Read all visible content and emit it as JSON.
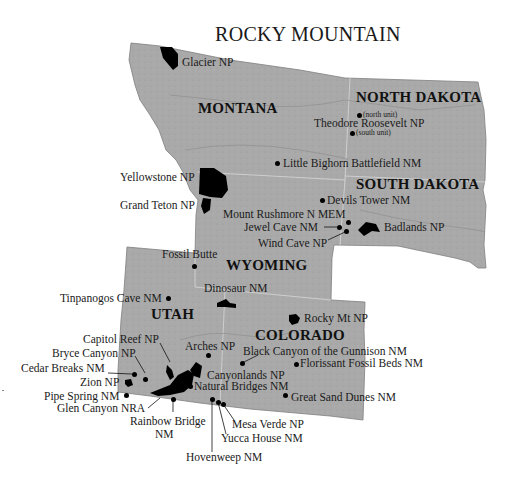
{
  "title": "ROCKY MOUNTAIN",
  "colors": {
    "land": "#a8a8a8",
    "park_fill": "#000000",
    "label": "#1a1a1a",
    "background": "#ffffff"
  },
  "states": [
    {
      "name": "MONTANA"
    },
    {
      "name": "NORTH DAKOTA"
    },
    {
      "name": "SOUTH DAKOTA"
    },
    {
      "name": "WYOMING"
    },
    {
      "name": "UTAH"
    },
    {
      "name": "COLORADO"
    }
  ],
  "sites": [
    {
      "label": "Glacier NP"
    },
    {
      "label": "Theodore Roosevelt NP",
      "north_unit": "(north unit)",
      "south_unit": "(south unit)"
    },
    {
      "label": "Little Bighorn Battlefield NM"
    },
    {
      "label": "Yellowstone NP"
    },
    {
      "label": "Grand Teton NP"
    },
    {
      "label": "Devils Tower NM"
    },
    {
      "label": "Mount Rushmore N MEM"
    },
    {
      "label": "Jewel Cave NM"
    },
    {
      "label": "Wind Cave NP"
    },
    {
      "label": "Badlands NP"
    },
    {
      "label": "Fossil Butte"
    },
    {
      "label": "Dinosaur  NM"
    },
    {
      "label": "Tinpanogos Cave NM"
    },
    {
      "label": "Rocky Mt NP"
    },
    {
      "label": "Capitol Reef NP"
    },
    {
      "label": "Bryce Canyon NP"
    },
    {
      "label": "Cedar Breaks NM"
    },
    {
      "label": "Zion NP"
    },
    {
      "label": "Pipe Spring NM"
    },
    {
      "label": "Glen Canyon NRA"
    },
    {
      "label": "Rainbow Bridge",
      "label2": "NM"
    },
    {
      "label": "Arches NP"
    },
    {
      "label": "Canyonlands NP"
    },
    {
      "label": "Natural Bridges NM"
    },
    {
      "label": "Black Canyon of the Gunnison NM"
    },
    {
      "label": "Florissant Fossil Beds NM"
    },
    {
      "label": "Great Sand Dunes NM"
    },
    {
      "label": "Mesa Verde NP"
    },
    {
      "label": "Yucca House NM"
    },
    {
      "label": "Hovenweep NM"
    }
  ]
}
